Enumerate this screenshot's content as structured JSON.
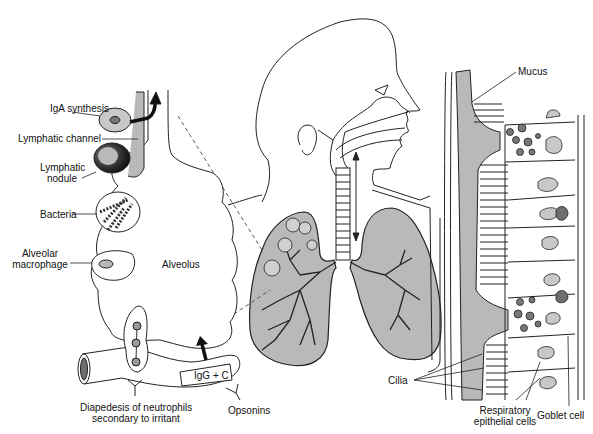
{
  "diagram": {
    "colors": {
      "line": "#222222",
      "fill_gray": "#b9b9b9",
      "fill_dark": "#6e6e6e",
      "node_dark": "#2a2a2a",
      "background": "#ffffff"
    },
    "left_panel": {
      "labels": {
        "iga_synthesis": "IgA synthesis",
        "lymphatic_channel": "Lymphatic channel",
        "lymphatic_nodule_1": "Lymphatic",
        "lymphatic_nodule_2": "nodule",
        "bacteria": "Bacteria",
        "alveolar_macrophage_1": "Alveolar",
        "alveolar_macrophage_2": "macrophage",
        "alveolus": "Alveolus",
        "igg_c": "IgG + C",
        "diapedesis_1": "Diapedesis of neutrophils",
        "diapedesis_2": "secondary to irritant",
        "opsonins": "Opsonins"
      }
    },
    "center_panel": {
      "parts": [
        "head",
        "nasal passage",
        "trachea",
        "left lung",
        "right lung",
        "bronchial tree",
        "mucociliary arrow"
      ]
    },
    "right_panel": {
      "labels": {
        "mucus": "Mucus",
        "cilia": "Cilia",
        "respiratory_epithelial_1": "Respiratory",
        "respiratory_epithelial_2": "epithelial cells",
        "goblet_cell": "Goblet cell"
      }
    }
  }
}
